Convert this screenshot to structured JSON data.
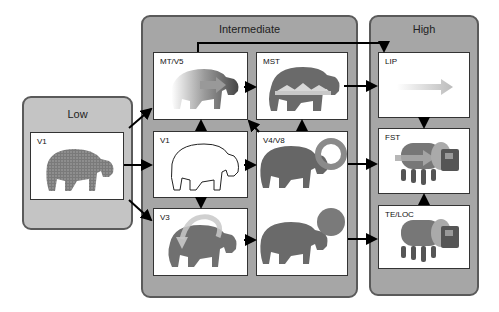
{
  "panels": {
    "low": {
      "title": "Low"
    },
    "intermediate": {
      "title": "Intermediate"
    },
    "high": {
      "title": "High"
    }
  },
  "areas": {
    "low_v1": {
      "label": "V1",
      "depiction": "textured-hippo"
    },
    "mt_v5": {
      "label": "MT/V5",
      "depiction": "motion-blurred-hippo-with-arrow"
    },
    "mst": {
      "label": "MST",
      "depiction": "hippo-silhouette-with-flow-arrows"
    },
    "v1": {
      "label": "V1",
      "depiction": "hippo-line-drawing"
    },
    "v4_v8": {
      "label": "V4/V8",
      "depiction": "two-hippos-with-ring-and-disk"
    },
    "v3": {
      "label": "V3",
      "depiction": "hippo-with-curved-rotation-arrow"
    },
    "lip": {
      "label": "LIP",
      "depiction": "gradient-arrow"
    },
    "fst": {
      "label": "FST",
      "depiction": "tanker-truck-with-arrow"
    },
    "te_loc": {
      "label": "TE/LOC",
      "depiction": "tanker-truck"
    }
  },
  "colors": {
    "panel_fill": "#a6a6a6",
    "low_panel_fill": "#c4c4c4",
    "panel_border": "#5a5a5a",
    "box_fill": "#ffffff",
    "arrow": "#000000",
    "hippo": "#6e6e6e"
  }
}
